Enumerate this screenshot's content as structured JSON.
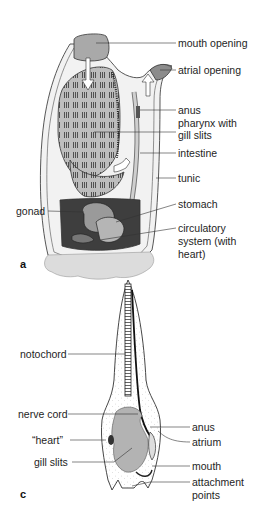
{
  "figure_a": {
    "panel_label": "a",
    "labels": {
      "mouth_opening": "mouth opening",
      "atrial_opening": "atrial opening",
      "anus": "anus",
      "pharynx_line1": "pharynx with",
      "pharynx_line2": "gill slits",
      "intestine": "intestine",
      "tunic": "tunic",
      "gonad": "gonad",
      "stomach": "stomach",
      "circ_line1": "circulatory",
      "circ_line2": "system (with",
      "circ_line3": "heart)"
    }
  },
  "figure_c": {
    "panel_label": "c",
    "labels": {
      "notochord": "notochord",
      "nerve_cord": "nerve cord",
      "heart": "“heart”",
      "gill_slits": "gill slits",
      "anus": "anus",
      "atrium": "atrium",
      "mouth": "mouth",
      "attach_line1": "attachment",
      "attach_line2": "points"
    }
  },
  "colors": {
    "line": "#333333",
    "fill_light": "#d9d9d9",
    "fill_mid": "#a8a8a8",
    "fill_dark": "#4a4a4a",
    "background": "#ffffff"
  }
}
